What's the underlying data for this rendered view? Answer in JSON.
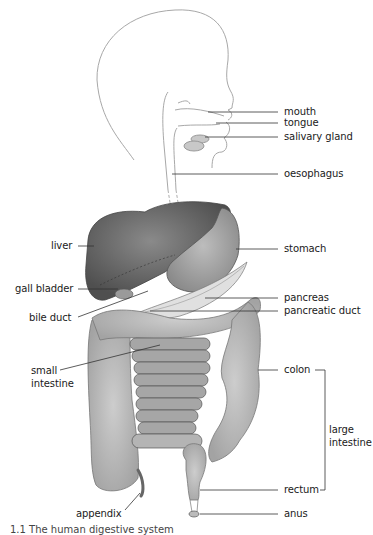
{
  "diagram": {
    "type": "anatomy",
    "subject": "human digestive system",
    "labels": {
      "mouth": "mouth",
      "tongue": "tongue",
      "salivary_gland": "salivary gland",
      "oesophagus": "oesophagus",
      "liver": "liver",
      "stomach": "stomach",
      "gall_bladder": "gall bladder",
      "bile_duct": "bile duct",
      "pancreas": "pancreas",
      "pancreatic_duct": "pancreatic duct",
      "small_intestine_1": "small",
      "small_intestine_2": "intestine",
      "colon": "colon",
      "large_intestine_1": "large",
      "large_intestine_2": "intestine",
      "rectum": "rectum",
      "appendix": "appendix",
      "anus": "anus"
    },
    "caption": "1.1  The human digestive system"
  },
  "colors": {
    "outline": "#9a9a9a",
    "leader": "#333333",
    "liver": "#5f5f5f",
    "stomach": "#9c9c9c",
    "intestine": "#b4b4b4",
    "pancreas": "#dcdcdc"
  }
}
